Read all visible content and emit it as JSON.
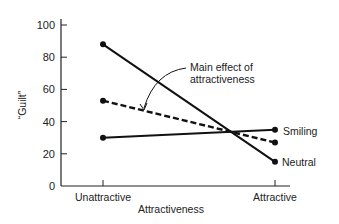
{
  "chart_data": {
    "type": "line",
    "title": "",
    "xlabel": "Attractiveness",
    "ylabel": "“Guilt”",
    "categories": [
      "Unattractive",
      "Attractive"
    ],
    "ylim": [
      0,
      100
    ],
    "yticks": [
      0,
      20,
      40,
      60,
      80,
      100
    ],
    "grid": false,
    "series": [
      {
        "name": "Neutral",
        "values": [
          88,
          15
        ],
        "style": "solid"
      },
      {
        "name": "Main effect of attractiveness",
        "values": [
          53,
          27
        ],
        "style": "dashed"
      },
      {
        "name": "Smiling",
        "values": [
          30,
          35
        ],
        "style": "solid"
      }
    ],
    "annotations": [
      {
        "text": "Main effect of\nattractiveness",
        "points_to": "dashed line (average)"
      }
    ],
    "legend_position": "inline labels at right end of lines"
  },
  "labels": {
    "annotation_line1": "Main effect of",
    "annotation_line2": "attractiveness",
    "smiling": "Smiling",
    "neutral": "Neutral"
  },
  "colors": {
    "line": "#111111",
    "axis": "#222222"
  }
}
